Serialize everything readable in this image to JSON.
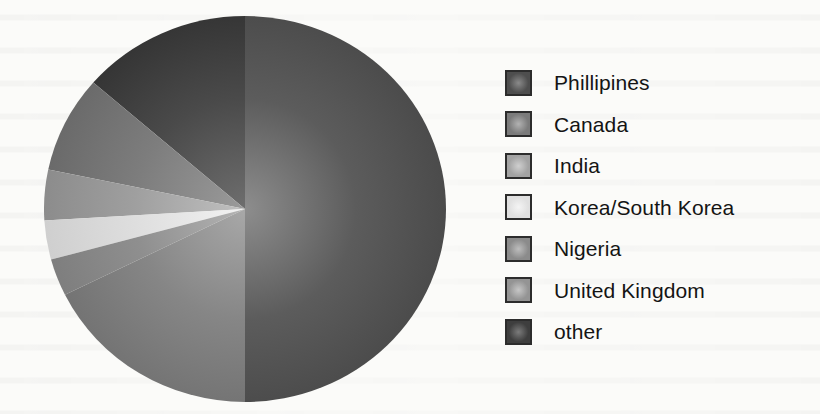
{
  "background_color": "#fbfbf9",
  "chart_data": {
    "type": "pie",
    "title": "",
    "subtitle": "",
    "xlabel": "",
    "ylabel": "",
    "legend_position": "right",
    "grid": false,
    "start_angle_deg": 0,
    "direction": "counterclockwise",
    "categories": [
      "Phillipines",
      "Canada",
      "India",
      "Korea/South Korea",
      "United Kingdom",
      "Nigeria",
      "other"
    ],
    "values": [
      13.6,
      8.1,
      4.2,
      3.3,
      3.1,
      17.7,
      50.0
    ],
    "unit": "percent",
    "slices": [
      {
        "label": "Phillipines",
        "value": 13.6,
        "color": "#4a4a4a",
        "edge_color": "#343434",
        "center_color": "#6e6e6e",
        "start_angle_deg": 0,
        "end_angle_deg": 49.0
      },
      {
        "label": "Canada",
        "value": 8.1,
        "color": "#7d7d7d",
        "edge_color": "#6a6a6a",
        "center_color": "#9a9a9a",
        "start_angle_deg": 49.0,
        "end_angle_deg": 78.2
      },
      {
        "label": "India",
        "value": 4.2,
        "color": "#9f9f9f",
        "edge_color": "#8c8c8c",
        "center_color": "#c0c0c0",
        "start_angle_deg": 78.2,
        "end_angle_deg": 93.4
      },
      {
        "label": "Korea/South Korea",
        "value": 3.3,
        "color": "#dedede",
        "edge_color": "#cfcfcf",
        "center_color": "#f2f2f2",
        "start_angle_deg": 93.4,
        "end_angle_deg": 105.2
      },
      {
        "label": "United Kingdom",
        "value": 3.1,
        "color": "#8f8f8f",
        "edge_color": "#7e7e7e",
        "center_color": "#b4b4b4",
        "start_angle_deg": 105.2,
        "end_angle_deg": 116.4
      },
      {
        "label": "Nigeria",
        "value": 17.7,
        "color": "#868686",
        "edge_color": "#737373",
        "center_color": "#a8a8a8",
        "start_angle_deg": 116.4,
        "end_angle_deg": 180.0
      },
      {
        "label": "other",
        "value": 50.0,
        "color": "#5c5c5c",
        "edge_color": "#4b4b4b",
        "center_color": "#8d8d8d",
        "start_angle_deg": 180.0,
        "end_angle_deg": 360.0
      }
    ]
  },
  "legend": {
    "items": [
      {
        "label": "Phillipines",
        "swatch_color": "#4e4e4e",
        "swatch_center": "#8a8a8a"
      },
      {
        "label": "Canada",
        "swatch_color": "#7b7b7b",
        "swatch_center": "#b2b2b2"
      },
      {
        "label": "India",
        "swatch_color": "#a3a3a3",
        "swatch_center": "#cfcfcf"
      },
      {
        "label": "Korea/South Korea",
        "swatch_color": "#e0e0e0",
        "swatch_center": "#f4f4f4"
      },
      {
        "label": "Nigeria",
        "swatch_color": "#8b8b8b",
        "swatch_center": "#bdbdbd"
      },
      {
        "label": "United Kingdom",
        "swatch_color": "#949494",
        "swatch_center": "#c6c6c6"
      },
      {
        "label": "other",
        "swatch_color": "#3e3e3e",
        "swatch_center": "#7b7b7b"
      }
    ]
  }
}
